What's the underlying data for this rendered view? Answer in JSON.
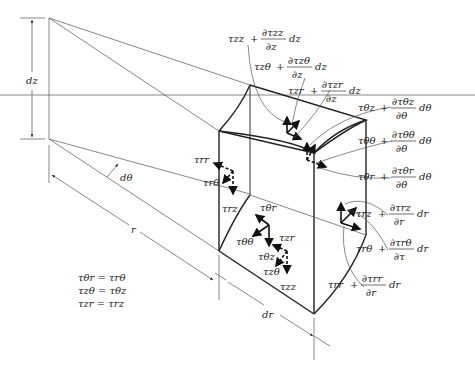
{
  "figure": {
    "dimension_labels": {
      "dz": "dz",
      "dtheta": "dθ",
      "r": "r",
      "dr": "dr"
    },
    "face_stress_labels": {
      "trr": "τrr",
      "trtheta": "τrθ",
      "trz": "τrz",
      "tthetar": "τθr",
      "tthetatheta": "τθθ",
      "tthetaz": "τθz",
      "tzr": "τzr",
      "tztheta": "τzθ",
      "tzz": "τzz"
    },
    "increment_labels": [
      {
        "base": "τzz",
        "num": "∂τzz",
        "den": "∂z",
        "diff": "dz"
      },
      {
        "base": "τzθ",
        "num": "∂τzθ",
        "den": "∂z",
        "diff": "dz"
      },
      {
        "base": "τzr",
        "num": "∂τzr",
        "den": "∂z",
        "diff": "dz"
      },
      {
        "base": "τθz",
        "num": "∂τθz",
        "den": "∂θ",
        "diff": "dθ"
      },
      {
        "base": "τθθ",
        "num": "∂τθθ",
        "den": "∂θ",
        "diff": "dθ"
      },
      {
        "base": "τθr",
        "num": "∂τθr",
        "den": "∂θ",
        "diff": "dθ"
      },
      {
        "base": "τrz",
        "num": "∂τrz",
        "den": "∂r",
        "diff": "dr"
      },
      {
        "base": "τrθ",
        "num": "∂τrθ",
        "den": "∂τ",
        "diff": "dr"
      },
      {
        "base": "τrr",
        "num": "∂τrr",
        "den": "∂r",
        "diff": "dr"
      }
    ],
    "plus_sign": "+",
    "symmetry_relations": [
      "τθr = τrθ",
      "τzθ = τθz",
      "τzr = τrz"
    ]
  }
}
